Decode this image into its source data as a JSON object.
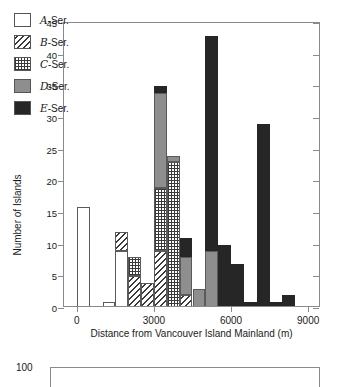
{
  "chart_data": {
    "type": "bar",
    "title": "",
    "subtitle": "",
    "xlabel": "Distance from Vancouver Island Mainland (m)",
    "ylabel": "Number of Islands",
    "xlim": [
      -500,
      9500
    ],
    "ylim": [
      0,
      45
    ],
    "xticks": [
      0,
      3000,
      6000,
      9000
    ],
    "yticks": [
      0,
      5,
      10,
      15,
      20,
      25,
      30,
      35,
      40,
      45
    ],
    "grid": false,
    "legend_position": "top-left",
    "stacked": true,
    "bin_width": 500,
    "legend": [
      {
        "key": "A",
        "label": "A-Ser.",
        "fill": "white",
        "color": "#ffffff"
      },
      {
        "key": "B",
        "label": "B-Ser.",
        "fill": "diagonal-hatch",
        "color": "#3a3a3a"
      },
      {
        "key": "C",
        "label": "C-Ser.",
        "fill": "cross-hatch-dots",
        "color": "#3a3a3a"
      },
      {
        "key": "D",
        "label": "D-Ser.",
        "fill": "gray",
        "color": "#8e8e8e"
      },
      {
        "key": "E",
        "label": "E-Ser.",
        "fill": "black",
        "color": "#262626"
      }
    ],
    "series": [
      {
        "name": "A-Ser.",
        "values": [
          16,
          0,
          1,
          9,
          0,
          0,
          0,
          0,
          0,
          0,
          0,
          0,
          0,
          0,
          0,
          0,
          0
        ]
      },
      {
        "name": "B-Ser.",
        "values": [
          0,
          0,
          0,
          3,
          5,
          4,
          9,
          0,
          2,
          0,
          0,
          0,
          0,
          0,
          0,
          0,
          0
        ]
      },
      {
        "name": "C-Ser.",
        "values": [
          0,
          0,
          0,
          0,
          3,
          0,
          10,
          23,
          0,
          0,
          0,
          0,
          0,
          0,
          0,
          0,
          0
        ]
      },
      {
        "name": "D-Ser.",
        "values": [
          0,
          0,
          0,
          0,
          0,
          0,
          15,
          1,
          6,
          3,
          9,
          0,
          0,
          0,
          0,
          0,
          0
        ]
      },
      {
        "name": "E-Ser.",
        "values": [
          0,
          0,
          0,
          0,
          0,
          0,
          1,
          0,
          3,
          0,
          34,
          10,
          7,
          1,
          29,
          1,
          2
        ]
      }
    ],
    "bin_starts": [
      0,
      500,
      1000,
      1500,
      2000,
      2500,
      3000,
      3500,
      4000,
      4500,
      5000,
      5500,
      6000,
      6500,
      7000,
      7500,
      8000
    ],
    "bin_totals": [
      16,
      0,
      1,
      12,
      8,
      4,
      35,
      24,
      9,
      3,
      43,
      10,
      7,
      1,
      29,
      1,
      2
    ]
  },
  "chart": {
    "xlabel": "Distance from Vancouver Island Mainland (m)",
    "ylabel": "Number of Islands",
    "xticks": [
      "0",
      "3000",
      "6000",
      "9000"
    ],
    "yticks": [
      "0",
      "5",
      "10",
      "15",
      "20",
      "25",
      "30",
      "35",
      "40",
      "45"
    ],
    "legend": [
      {
        "letter": "A",
        "rest": "-Ser."
      },
      {
        "letter": "B",
        "rest": "-Ser."
      },
      {
        "letter": "C",
        "rest": "-Ser."
      },
      {
        "letter": "D",
        "rest": "-Ser."
      },
      {
        "letter": "E",
        "rest": "-Ser."
      }
    ]
  },
  "lower_chart": {
    "ytop_label": "100"
  }
}
